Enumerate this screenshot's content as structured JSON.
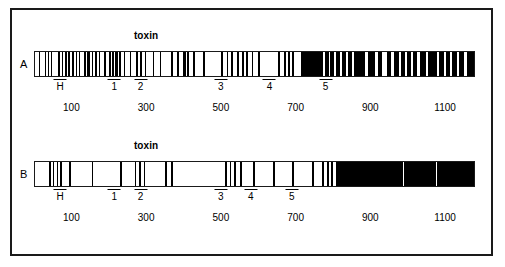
{
  "figure": {
    "axis_min": 0,
    "axis_max": 1180,
    "toxin_label": "toxin"
  },
  "panels": [
    {
      "id": "A",
      "letter": "A",
      "toxin_label": "toxin",
      "toxin_position": 300,
      "markers": [
        {
          "label": "H",
          "position": 70
        },
        {
          "label": "1",
          "position": 215
        },
        {
          "label": "2",
          "position": 285
        },
        {
          "label": "3",
          "position": 500
        },
        {
          "label": "4",
          "position": 630
        },
        {
          "label": "5",
          "position": 780
        }
      ],
      "ticks": [
        {
          "label": "100",
          "position": 100
        },
        {
          "label": "300",
          "position": 300
        },
        {
          "label": "500",
          "position": 500
        },
        {
          "label": "700",
          "position": 700
        },
        {
          "label": "900",
          "position": 900
        },
        {
          "label": "1100",
          "position": 1100
        }
      ],
      "bands": [
        {
          "start": 10,
          "width": 4
        },
        {
          "start": 26,
          "width": 3
        },
        {
          "start": 34,
          "width": 4
        },
        {
          "start": 44,
          "width": 3
        },
        {
          "start": 62,
          "width": 4
        },
        {
          "start": 72,
          "width": 3
        },
        {
          "start": 80,
          "width": 5
        },
        {
          "start": 90,
          "width": 4
        },
        {
          "start": 99,
          "width": 6
        },
        {
          "start": 109,
          "width": 4
        },
        {
          "start": 118,
          "width": 3
        },
        {
          "start": 132,
          "width": 4
        },
        {
          "start": 141,
          "width": 7
        },
        {
          "start": 152,
          "width": 4
        },
        {
          "start": 161,
          "width": 5
        },
        {
          "start": 172,
          "width": 3
        },
        {
          "start": 186,
          "width": 4
        },
        {
          "start": 198,
          "width": 5
        },
        {
          "start": 208,
          "width": 4
        },
        {
          "start": 216,
          "width": 7
        },
        {
          "start": 227,
          "width": 4
        },
        {
          "start": 238,
          "width": 5
        },
        {
          "start": 255,
          "width": 4
        },
        {
          "start": 272,
          "width": 5
        },
        {
          "start": 283,
          "width": 4
        },
        {
          "start": 296,
          "width": 3
        },
        {
          "start": 316,
          "width": 4
        },
        {
          "start": 336,
          "width": 4
        },
        {
          "start": 366,
          "width": 5
        },
        {
          "start": 383,
          "width": 4
        },
        {
          "start": 398,
          "width": 7
        },
        {
          "start": 409,
          "width": 4
        },
        {
          "start": 424,
          "width": 5
        },
        {
          "start": 452,
          "width": 4
        },
        {
          "start": 500,
          "width": 4
        },
        {
          "start": 516,
          "width": 4
        },
        {
          "start": 528,
          "width": 5
        },
        {
          "start": 544,
          "width": 4
        },
        {
          "start": 556,
          "width": 7
        },
        {
          "start": 568,
          "width": 4
        },
        {
          "start": 582,
          "width": 5
        },
        {
          "start": 600,
          "width": 4
        },
        {
          "start": 653,
          "width": 5
        },
        {
          "start": 668,
          "width": 8
        },
        {
          "start": 681,
          "width": 5
        },
        {
          "start": 692,
          "width": 4
        },
        {
          "start": 716,
          "width": 58
        },
        {
          "start": 780,
          "width": 10
        },
        {
          "start": 794,
          "width": 10
        },
        {
          "start": 810,
          "width": 9
        },
        {
          "start": 824,
          "width": 12
        },
        {
          "start": 842,
          "width": 10
        },
        {
          "start": 858,
          "width": 28
        },
        {
          "start": 894,
          "width": 20
        },
        {
          "start": 922,
          "width": 12
        },
        {
          "start": 946,
          "width": 10
        },
        {
          "start": 966,
          "width": 12
        },
        {
          "start": 984,
          "width": 10
        },
        {
          "start": 1000,
          "width": 10
        },
        {
          "start": 1016,
          "width": 12
        },
        {
          "start": 1034,
          "width": 16
        },
        {
          "start": 1056,
          "width": 24
        },
        {
          "start": 1086,
          "width": 14
        },
        {
          "start": 1106,
          "width": 10
        },
        {
          "start": 1122,
          "width": 12
        },
        {
          "start": 1140,
          "width": 14
        },
        {
          "start": 1160,
          "width": 20
        }
      ]
    },
    {
      "id": "B",
      "letter": "B",
      "toxin_label": "toxin",
      "toxin_position": 300,
      "markers": [
        {
          "label": "H",
          "position": 70
        },
        {
          "label": "1",
          "position": 215
        },
        {
          "label": "2",
          "position": 285
        },
        {
          "label": "3",
          "position": 500
        },
        {
          "label": "4",
          "position": 580
        },
        {
          "label": "5",
          "position": 690
        }
      ],
      "ticks": [
        {
          "label": "100",
          "position": 100
        },
        {
          "label": "300",
          "position": 300
        },
        {
          "label": "500",
          "position": 500
        },
        {
          "label": "700",
          "position": 700
        },
        {
          "label": "900",
          "position": 900
        },
        {
          "label": "1100",
          "position": 1100
        }
      ],
      "bands": [
        {
          "start": 38,
          "width": 4
        },
        {
          "start": 48,
          "width": 4
        },
        {
          "start": 58,
          "width": 4
        },
        {
          "start": 68,
          "width": 4
        },
        {
          "start": 92,
          "width": 4
        },
        {
          "start": 152,
          "width": 4
        },
        {
          "start": 228,
          "width": 5
        },
        {
          "start": 268,
          "width": 4
        },
        {
          "start": 280,
          "width": 4
        },
        {
          "start": 292,
          "width": 4
        },
        {
          "start": 350,
          "width": 4
        },
        {
          "start": 366,
          "width": 4
        },
        {
          "start": 512,
          "width": 4
        },
        {
          "start": 524,
          "width": 4
        },
        {
          "start": 536,
          "width": 4
        },
        {
          "start": 552,
          "width": 4
        },
        {
          "start": 586,
          "width": 5
        },
        {
          "start": 640,
          "width": 5
        },
        {
          "start": 692,
          "width": 5
        },
        {
          "start": 744,
          "width": 5
        },
        {
          "start": 772,
          "width": 5
        },
        {
          "start": 784,
          "width": 5
        },
        {
          "start": 796,
          "width": 5
        },
        {
          "start": 808,
          "width": 372
        }
      ],
      "reverse_gaps": [
        {
          "start": 990,
          "width": 3
        },
        {
          "start": 1078,
          "width": 3
        }
      ]
    }
  ]
}
